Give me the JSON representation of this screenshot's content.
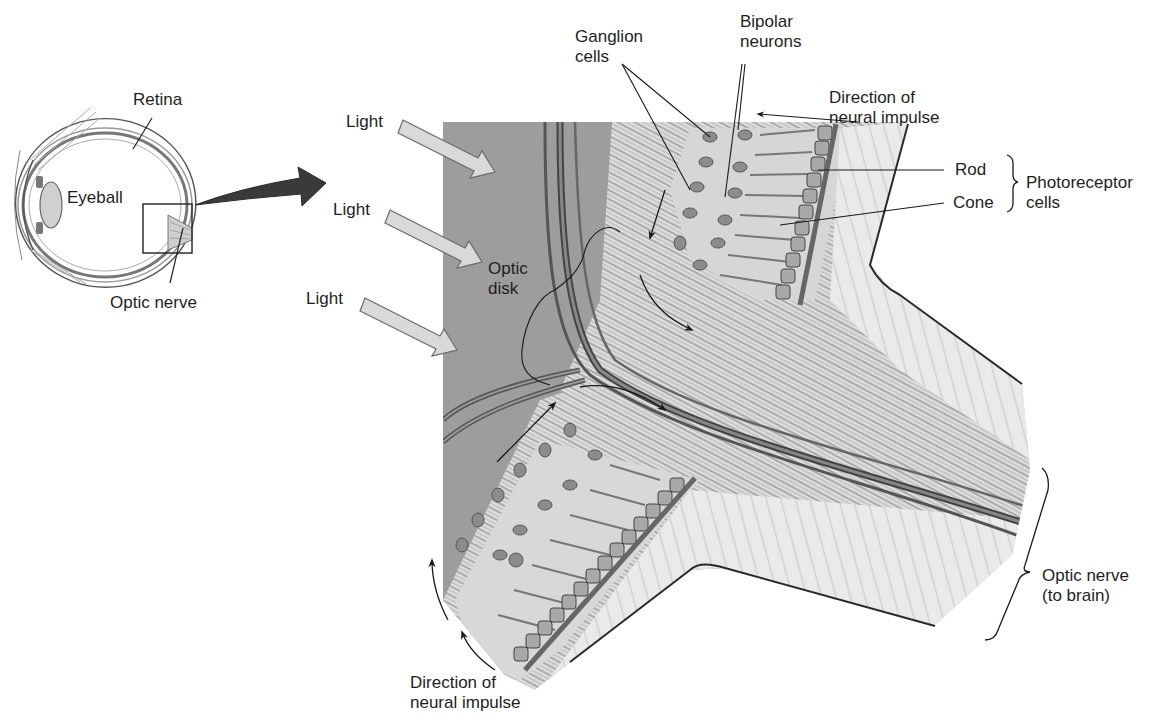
{
  "diagram": {
    "type": "anatomy-illustration",
    "colors": {
      "background": "#ffffff",
      "vitreous_gray": "#9e9e9e",
      "retina_light": "#dcdcdc",
      "nerve_fiber": "#c8c8c8",
      "cell_body": "#8a8a8a",
      "outline": "#333333",
      "light_arrow_fill": "#d8d8d8",
      "zoom_arrow": "#333333"
    }
  },
  "eye_inset": {
    "labels": {
      "retina": "Retina",
      "eyeball": "Eyeball",
      "optic_nerve": "Optic nerve"
    }
  },
  "main": {
    "light_labels": [
      "Light",
      "Light",
      "Light"
    ],
    "optic_disk": "Optic\ndisk",
    "ganglion_cells": "Ganglion\ncells",
    "bipolar_neurons": "Bipolar\nneurons",
    "direction_top": "Direction of\nneural impulse",
    "rod": "Rod",
    "cone": "Cone",
    "photoreceptor_cells": "Photoreceptor\ncells",
    "optic_nerve_brain": "Optic nerve\n(to brain)",
    "direction_bottom": "Direction of\nneural impulse"
  }
}
